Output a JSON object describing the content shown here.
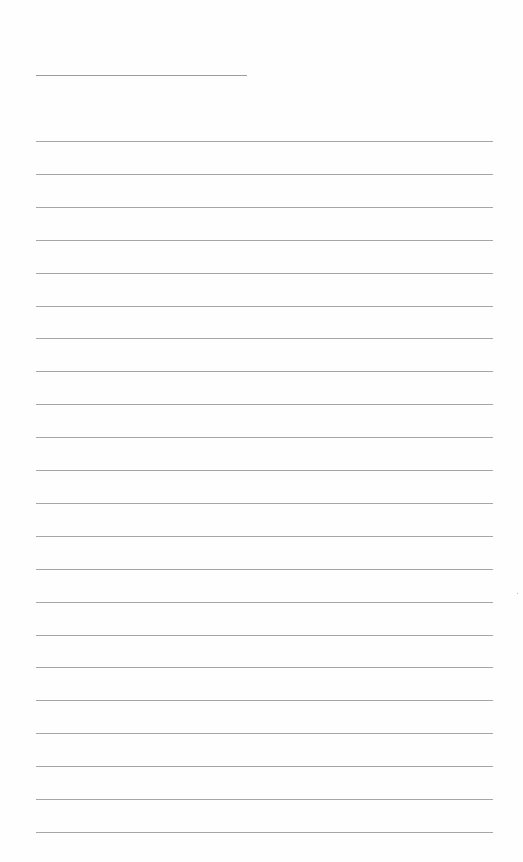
{
  "page": {
    "type": "lined-paper",
    "background_color": "#fefefe",
    "line_color": "#a6a6a6",
    "header_line": {
      "x": 36,
      "y": 75,
      "width": 211
    },
    "ruled_lines": {
      "count": 22,
      "x": 36,
      "width": 457,
      "first_y": 141,
      "spacing": 32.9
    },
    "text": ""
  }
}
